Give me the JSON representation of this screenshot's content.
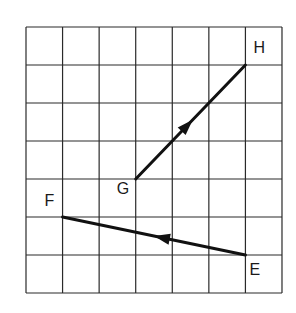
{
  "diagram": {
    "type": "vector-grid",
    "grid": {
      "columns": 7,
      "rows": 7,
      "origin_px": [
        26,
        27
      ],
      "cell_w_px": 36.57,
      "cell_h_px": 38,
      "line_color": "#2a2a2a"
    },
    "points": [
      {
        "id": "H",
        "label": "H",
        "grid": [
          6,
          1
        ],
        "label_offset": [
          8,
          -12
        ]
      },
      {
        "id": "G",
        "label": "G",
        "grid": [
          3,
          4
        ],
        "label_offset": [
          -19,
          15
        ]
      },
      {
        "id": "F",
        "label": "F",
        "grid": [
          1,
          5
        ],
        "label_offset": [
          -18,
          -11
        ]
      },
      {
        "id": "E",
        "label": "E",
        "grid": [
          6,
          6
        ],
        "label_offset": [
          4,
          20
        ]
      }
    ],
    "vectors": [
      {
        "id": "GH",
        "from": "G",
        "to": "H",
        "arrow_at": 0.52,
        "color": "#111111"
      },
      {
        "id": "EF",
        "from": "E",
        "to": "F",
        "arrow_at": 0.5,
        "color": "#111111"
      }
    ]
  }
}
